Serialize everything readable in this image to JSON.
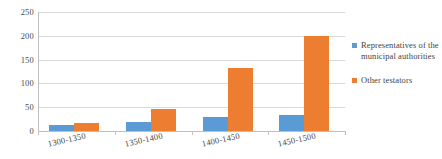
{
  "chart_data": {
    "type": "bar",
    "title": "",
    "subtitle": "",
    "xlabel": "",
    "ylabel": "",
    "categories": [
      "1300-1350",
      "1350-1400",
      "1400-1450",
      "1450-1500"
    ],
    "series": [
      {
        "name": "Representatives of the municipal authorities",
        "color": "#5B9BD5",
        "values": [
          12,
          18,
          30,
          34
        ]
      },
      {
        "name": "Other testators",
        "color": "#ED7D31",
        "values": [
          17,
          46,
          133,
          199
        ]
      }
    ],
    "ylim": [
      0,
      250
    ],
    "yticks": [
      0,
      50,
      100,
      150,
      200,
      250
    ],
    "ytick_labels": [
      "0",
      "50",
      "100",
      "150",
      "200",
      "250"
    ],
    "grid": "horizontal",
    "legend_position": "right",
    "annotations": []
  },
  "legend": {
    "entries": [
      {
        "label": "Representatives of the municipal authorities",
        "color": "#5B9BD5"
      },
      {
        "label": "Other testators",
        "color": "#ED7D31"
      }
    ]
  },
  "colors": {
    "series_blue": "#5B9BD5",
    "series_orange": "#ED7D31",
    "gridline": "#D9D9D9",
    "axis": "#BFBFBF",
    "text": "#3F3F3F",
    "background": "#FFFFFF"
  }
}
